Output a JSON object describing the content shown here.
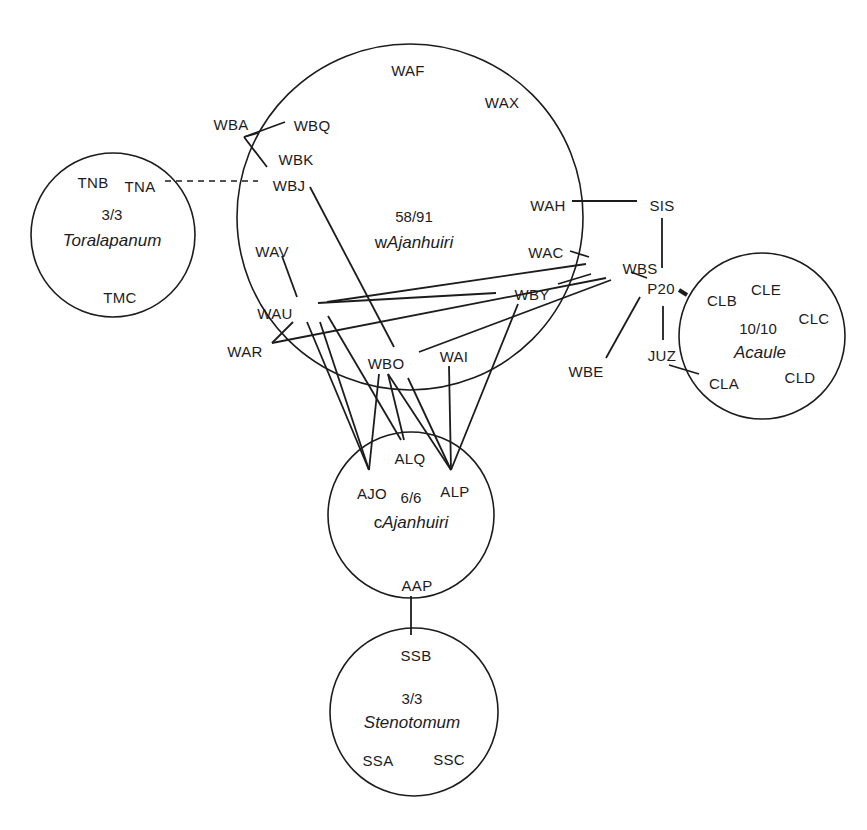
{
  "diagram": {
    "type": "network",
    "colors": {
      "ink": "#1c1c1c",
      "background": "#ffffff"
    },
    "groups": [
      {
        "id": "wajanhuiri",
        "count": "58/91",
        "prefix": "w",
        "name": "Ajanhuiri",
        "cx": 410,
        "cy": 217,
        "r": 173,
        "count_pos": [
          414,
          222
        ],
        "name_pos": [
          414,
          248
        ]
      },
      {
        "id": "toralapanum",
        "count": "3/3",
        "prefix": "",
        "name": "Toralapanum",
        "cx": 113,
        "cy": 235,
        "r": 82,
        "count_pos": [
          112,
          220
        ],
        "name_pos": [
          112,
          246
        ]
      },
      {
        "id": "acaule",
        "count": "10/10",
        "prefix": "",
        "name": "Acaule",
        "cx": 762,
        "cy": 336,
        "r": 83,
        "count_pos": [
          758,
          334
        ],
        "name_pos": [
          760,
          358
        ]
      },
      {
        "id": "cajanhuiri",
        "count": "6/6",
        "prefix": "c",
        "name": "Ajanhuiri",
        "cx": 411,
        "cy": 515,
        "r": 83,
        "count_pos": [
          411,
          503
        ],
        "name_pos": [
          411,
          528
        ]
      },
      {
        "id": "stenotomum",
        "count": "3/3",
        "prefix": "",
        "name": "Stenotomum",
        "cx": 414,
        "cy": 712,
        "r": 84,
        "count_pos": [
          412,
          704
        ],
        "name_pos": [
          412,
          728
        ]
      }
    ],
    "nodes": [
      {
        "id": "WAF",
        "x": 408,
        "y": 71
      },
      {
        "id": "WAX",
        "x": 502,
        "y": 103
      },
      {
        "id": "WBA",
        "x": 231,
        "y": 125
      },
      {
        "id": "WBQ",
        "x": 312,
        "y": 126
      },
      {
        "id": "WBK",
        "x": 296,
        "y": 160
      },
      {
        "id": "WBJ",
        "x": 289,
        "y": 186
      },
      {
        "id": "TNB",
        "x": 93,
        "y": 183
      },
      {
        "id": "TNA",
        "x": 140,
        "y": 187
      },
      {
        "id": "TMC",
        "x": 120,
        "y": 298
      },
      {
        "id": "WAH",
        "x": 548,
        "y": 206
      },
      {
        "id": "SIS",
        "x": 662,
        "y": 206
      },
      {
        "id": "WAV",
        "x": 272,
        "y": 252
      },
      {
        "id": "WAC",
        "x": 546,
        "y": 253
      },
      {
        "id": "WBS",
        "x": 640,
        "y": 269
      },
      {
        "id": "WBY",
        "x": 532,
        "y": 295
      },
      {
        "id": "P20",
        "x": 661,
        "y": 289
      },
      {
        "id": "WAU",
        "x": 275,
        "y": 314
      },
      {
        "id": "WAR",
        "x": 245,
        "y": 352
      },
      {
        "id": "WBO",
        "x": 386,
        "y": 364
      },
      {
        "id": "WAI",
        "x": 454,
        "y": 357
      },
      {
        "id": "WBE",
        "x": 586,
        "y": 372
      },
      {
        "id": "JUZ",
        "x": 662,
        "y": 356
      },
      {
        "id": "CLB",
        "x": 722,
        "y": 301
      },
      {
        "id": "CLE",
        "x": 766,
        "y": 290
      },
      {
        "id": "CLC",
        "x": 814,
        "y": 319
      },
      {
        "id": "CLA",
        "x": 724,
        "y": 384
      },
      {
        "id": "CLD",
        "x": 800,
        "y": 378
      },
      {
        "id": "ALQ",
        "x": 410,
        "y": 459
      },
      {
        "id": "AJO",
        "x": 372,
        "y": 494
      },
      {
        "id": "ALP",
        "x": 455,
        "y": 492
      },
      {
        "id": "AAP",
        "x": 417,
        "y": 586
      },
      {
        "id": "SSB",
        "x": 416,
        "y": 656
      },
      {
        "id": "SSA",
        "x": 378,
        "y": 761
      },
      {
        "id": "SSC",
        "x": 449,
        "y": 760
      }
    ],
    "edges": [
      {
        "from": "TNA",
        "to": "WBJ",
        "style": "dashed",
        "points": [
          165,
          181,
          258,
          181
        ]
      },
      {
        "from": "WBA",
        "to": "WBQ",
        "style": "solid",
        "points": [
          244,
          137,
          285,
          122
        ]
      },
      {
        "from": "WBA",
        "to": "WBJ",
        "style": "solid",
        "points": [
          244,
          137,
          258,
          133
        ]
      },
      {
        "from": "WBA",
        "to": "WBK",
        "style": "solid",
        "points": [
          244,
          137,
          267,
          167
        ]
      },
      {
        "from": "WBJ",
        "to": "WBO",
        "style": "solid",
        "points": [
          310,
          187,
          394,
          347
        ]
      },
      {
        "from": "WAH",
        "to": "SIS",
        "style": "solid",
        "points": [
          572,
          201,
          637,
          201
        ]
      },
      {
        "from": "SIS",
        "to": "P20",
        "style": "solid",
        "points": [
          662,
          218,
          662,
          268
        ]
      },
      {
        "from": "WAC",
        "to": "WBS",
        "style": "solid",
        "points": [
          570,
          251,
          589,
          257
        ]
      },
      {
        "from": "WBS",
        "to": "P20",
        "style": "solid",
        "points": [
          631,
          272,
          647,
          278
        ]
      },
      {
        "from": "P20",
        "to": "CLB",
        "style": "thick",
        "points": [
          679,
          290,
          687,
          295
        ]
      },
      {
        "from": "P20",
        "to": "WBE",
        "style": "solid",
        "points": [
          640,
          297,
          606,
          358
        ]
      },
      {
        "from": "P20",
        "to": "JUZ",
        "style": "solid",
        "points": [
          663,
          306,
          663,
          340
        ]
      },
      {
        "from": "JUZ",
        "to": "CLA",
        "style": "solid",
        "points": [
          669,
          365,
          699,
          374
        ]
      },
      {
        "from": "WAV",
        "to": "WAU",
        "style": "solid",
        "points": [
          282,
          256,
          297,
          297
        ]
      },
      {
        "from": "WAU",
        "to": "WBS",
        "style": "solid",
        "points": [
          327,
          302,
          586,
          264
        ]
      },
      {
        "from": "WAU",
        "to": "WBY",
        "style": "solid",
        "points": [
          318,
          303,
          496,
          293
        ]
      },
      {
        "from": "WBY",
        "to": "WBS",
        "style": "solid",
        "points": [
          558,
          284,
          591,
          274
        ]
      },
      {
        "from": "WAR",
        "to": "WAU",
        "style": "solid",
        "points": [
          272,
          343,
          293,
          322
        ]
      },
      {
        "from": "WAR",
        "to": "WBS",
        "style": "solid",
        "points": [
          272,
          343,
          606,
          278
        ]
      },
      {
        "from": "WBO",
        "to": "WBS",
        "style": "solid",
        "points": [
          419,
          352,
          611,
          280
        ]
      },
      {
        "from": "WAU",
        "to": "AJO",
        "style": "solid",
        "points": [
          307,
          322,
          369,
          470
        ]
      },
      {
        "from": "WAU",
        "to": "AJO",
        "style": "solid",
        "points": [
          320,
          322,
          369,
          470
        ]
      },
      {
        "from": "WAU",
        "to": "ALQ",
        "style": "solid",
        "points": [
          328,
          316,
          401,
          440
        ]
      },
      {
        "from": "WBO",
        "to": "AJO",
        "style": "solid",
        "points": [
          379,
          374,
          369,
          470
        ]
      },
      {
        "from": "WBO",
        "to": "ALQ",
        "style": "solid",
        "points": [
          388,
          374,
          404,
          440
        ]
      },
      {
        "from": "WBO",
        "to": "ALP",
        "style": "solid",
        "points": [
          388,
          374,
          451,
          470
        ]
      },
      {
        "from": "WBO",
        "to": "ALP",
        "style": "solid",
        "points": [
          408,
          378,
          451,
          470
        ]
      },
      {
        "from": "WAI",
        "to": "ALP",
        "style": "solid",
        "points": [
          449,
          366,
          451,
          470
        ]
      },
      {
        "from": "WBY",
        "to": "ALP",
        "style": "solid",
        "points": [
          518,
          304,
          451,
          470
        ]
      },
      {
        "from": "AAP",
        "to": "SSB",
        "style": "solid",
        "points": [
          411,
          596,
          411,
          635
        ]
      }
    ]
  }
}
